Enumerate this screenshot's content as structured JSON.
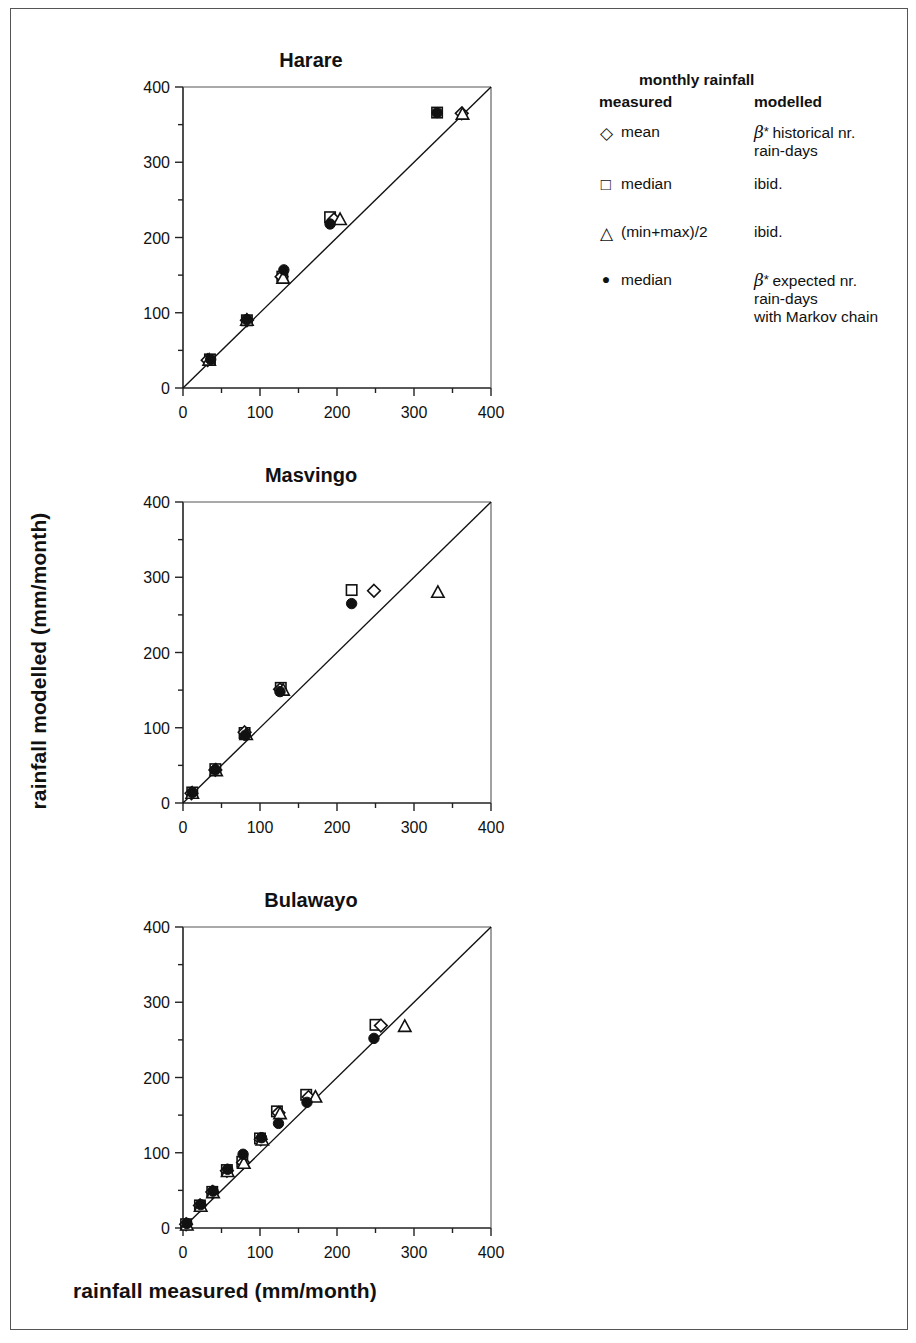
{
  "figure": {
    "xlabel": "rainfall measured (mm/month)",
    "ylabel": "rainfall modelled (mm/month)"
  },
  "legend": {
    "heading_top": "monthly rainfall",
    "heading_measured": "measured",
    "heading_modelled": "modelled",
    "rows": [
      {
        "symbol": "◇",
        "symbol_name": "diamond-open-marker",
        "measured": "mean",
        "modelled_line1": "historical nr.",
        "modelled_line2": "rain-days",
        "modelled_line3": "",
        "beta_prefix": true
      },
      {
        "symbol": "□",
        "symbol_name": "square-open-marker",
        "measured": "median",
        "modelled_line1": "ibid.",
        "modelled_line2": "",
        "modelled_line3": "",
        "beta_prefix": false
      },
      {
        "symbol": "△",
        "symbol_name": "triangle-open-marker",
        "measured": "(min+max)/2",
        "modelled_line1": "ibid.",
        "modelled_line2": "",
        "modelled_line3": "",
        "beta_prefix": false
      },
      {
        "symbol": "●",
        "symbol_name": "circle-filled-marker",
        "measured": "median",
        "modelled_line1": "expected nr.",
        "modelled_line2": "rain-days",
        "modelled_line3": "with Markov chain",
        "beta_prefix": true
      }
    ],
    "beta_glyph": "β",
    "star_glyph": "*"
  },
  "chart_data": [
    {
      "type": "scatter",
      "title": "Harare",
      "xlabel": "rainfall measured (mm/month)",
      "ylabel": "rainfall modelled (mm/month)",
      "xlim": [
        0,
        400
      ],
      "ylim": [
        0,
        400
      ],
      "xticks": [
        0,
        100,
        200,
        300,
        400
      ],
      "yticks": [
        0,
        100,
        200,
        300,
        400
      ],
      "minor_tick_step": 50,
      "grid": false,
      "identity_line": true,
      "series": [
        {
          "name": "mean (measured) vs beta * historical nr. rain-days",
          "marker": "diamond-open",
          "points": [
            [
              32,
              37
            ],
            [
              83,
              90
            ],
            [
              128,
              148
            ],
            [
              196,
              224
            ],
            [
              362,
              365
            ]
          ]
        },
        {
          "name": "median (measured) vs beta * historical nr. rain-days",
          "marker": "square-open",
          "points": [
            [
              35,
              38
            ],
            [
              83,
              90
            ],
            [
              129,
              148
            ],
            [
              191,
              227
            ],
            [
              330,
              366
            ]
          ]
        },
        {
          "name": "(min+max)/2 (measured) vs beta * historical nr. rain-days",
          "marker": "triangle-open",
          "points": [
            [
              34,
              37
            ],
            [
              83,
              90
            ],
            [
              130,
              146
            ],
            [
              204,
              224
            ],
            [
              363,
              364
            ]
          ]
        },
        {
          "name": "median (measured) vs beta * expected nr. rain-days with Markov chain",
          "marker": "circle-filled",
          "points": [
            [
              36,
              38
            ],
            [
              83,
              91
            ],
            [
              131,
              157
            ],
            [
              191,
              218
            ],
            [
              330,
              366
            ]
          ]
        }
      ]
    },
    {
      "type": "scatter",
      "title": "Masvingo",
      "xlabel": "rainfall measured (mm/month)",
      "ylabel": "rainfall modelled (mm/month)",
      "xlim": [
        0,
        400
      ],
      "ylim": [
        0,
        400
      ],
      "xticks": [
        0,
        100,
        200,
        300,
        400
      ],
      "yticks": [
        0,
        100,
        200,
        300,
        400
      ],
      "minor_tick_step": 50,
      "grid": false,
      "identity_line": true,
      "series": [
        {
          "name": "mean (measured) vs beta * historical nr. rain-days",
          "marker": "diamond-open",
          "points": [
            [
              11,
              13
            ],
            [
              42,
              44
            ],
            [
              80,
              94
            ],
            [
              126,
              151
            ],
            [
              248,
              282
            ]
          ]
        },
        {
          "name": "median (measured) vs beta * historical nr. rain-days",
          "marker": "square-open",
          "points": [
            [
              12,
              14
            ],
            [
              42,
              45
            ],
            [
              80,
              93
            ],
            [
              127,
              153
            ],
            [
              219,
              283
            ]
          ]
        },
        {
          "name": "(min+max)/2 (measured) vs beta * historical nr. rain-days",
          "marker": "triangle-open",
          "points": [
            [
              12,
              13
            ],
            [
              43,
              43
            ],
            [
              82,
              91
            ],
            [
              130,
              150
            ],
            [
              331,
              280
            ]
          ]
        },
        {
          "name": "median (measured) vs beta * expected nr. rain-days with Markov chain",
          "marker": "circle-filled",
          "points": [
            [
              12,
              14
            ],
            [
              42,
              44
            ],
            [
              81,
              90
            ],
            [
              126,
              148
            ],
            [
              219,
              265
            ]
          ]
        }
      ]
    },
    {
      "type": "scatter",
      "title": "Bulawayo",
      "xlabel": "rainfall measured (mm/month)",
      "ylabel": "rainfall modelled (mm/month)",
      "xlim": [
        0,
        400
      ],
      "ylim": [
        0,
        400
      ],
      "xticks": [
        0,
        100,
        200,
        300,
        400
      ],
      "yticks": [
        0,
        100,
        200,
        300,
        400
      ],
      "minor_tick_step": 50,
      "grid": false,
      "identity_line": true,
      "series": [
        {
          "name": "mean (measured) vs beta * historical nr. rain-days",
          "marker": "diamond-open",
          "points": [
            [
              4,
              5
            ],
            [
              22,
              30
            ],
            [
              38,
              48
            ],
            [
              57,
              76
            ],
            [
              78,
              87
            ],
            [
              101,
              118
            ],
            [
              124,
              153
            ],
            [
              163,
              174
            ],
            [
              257,
              269
            ]
          ]
        },
        {
          "name": "median (measured) vs beta * historical nr. rain-days",
          "marker": "square-open",
          "points": [
            [
              4,
              5
            ],
            [
              22,
              30
            ],
            [
              38,
              48
            ],
            [
              57,
              77
            ],
            [
              77,
              88
            ],
            [
              100,
              119
            ],
            [
              122,
              155
            ],
            [
              160,
              177
            ],
            [
              250,
              270
            ]
          ]
        },
        {
          "name": "(min+max)/2 (measured) vs beta * historical nr. rain-days",
          "marker": "triangle-open",
          "points": [
            [
              5,
              4
            ],
            [
              23,
              29
            ],
            [
              39,
              47
            ],
            [
              58,
              75
            ],
            [
              79,
              86
            ],
            [
              103,
              117
            ],
            [
              126,
              152
            ],
            [
              172,
              174
            ],
            [
              288,
              268
            ]
          ]
        },
        {
          "name": "median (measured) vs beta * expected nr. rain-days with Markov chain",
          "marker": "circle-filled",
          "points": [
            [
              5,
              6
            ],
            [
              23,
              31
            ],
            [
              39,
              49
            ],
            [
              58,
              78
            ],
            [
              78,
              98
            ],
            [
              102,
              120
            ],
            [
              124,
              139
            ],
            [
              161,
              167
            ],
            [
              248,
              252
            ]
          ]
        }
      ]
    }
  ]
}
